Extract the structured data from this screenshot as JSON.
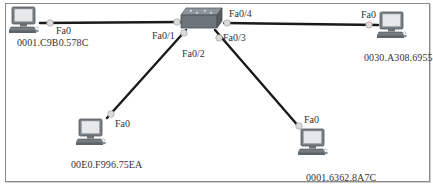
{
  "diagram": {
    "type": "network-topology",
    "colors": {
      "link": "#1a1a1a",
      "port_dot": "#d9d9d9",
      "frame": "#8a8a8a",
      "text": "#333333"
    },
    "switch": {
      "icon": "switch-icon",
      "ports": {
        "p1": "Fa0/1",
        "p2": "Fa0/2",
        "p3": "Fa0/3",
        "p4": "Fa0/4"
      }
    },
    "hosts": [
      {
        "id": "pc0",
        "icon": "pc-icon",
        "port": "Fa0",
        "mac": "0001.C9B0.578C",
        "switch_port": "Fa0/1"
      },
      {
        "id": "pc1",
        "icon": "pc-icon",
        "port": "Fa0",
        "mac": "0030.A308.6955",
        "switch_port": "Fa0/4"
      },
      {
        "id": "pc2",
        "icon": "pc-icon",
        "port": "Fa0",
        "mac": "00E0.F996.75EA",
        "switch_port": "Fa0/2"
      },
      {
        "id": "pc3",
        "icon": "pc-icon",
        "port": "Fa0",
        "mac": "0001.6362.8A7C",
        "switch_port": "Fa0/3"
      }
    ]
  }
}
